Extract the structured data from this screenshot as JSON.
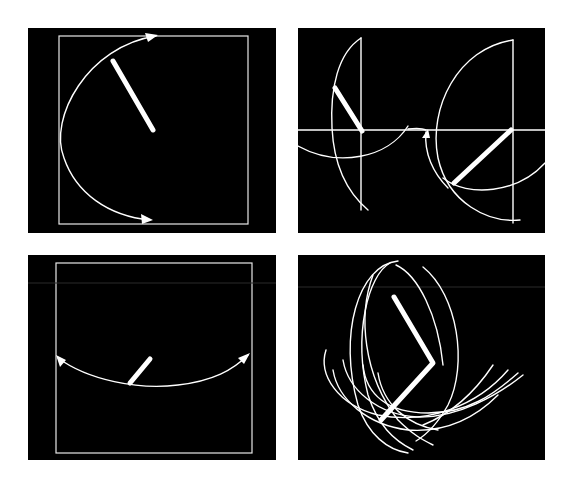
{
  "figure": {
    "panels": [
      {
        "id": "top-left",
        "description": "Rod pivoting from center within square frame; arc with arrows at top and bottom indicating swing"
      },
      {
        "id": "top-right",
        "description": "Two rods on a horizontal axis, each with circular swing arcs and a connecting arrow"
      },
      {
        "id": "bottom-left",
        "description": "Short rod at bottom of square frame with a shallow arc with arrows on both ends"
      },
      {
        "id": "bottom-right",
        "description": "Bent two-segment rod with many overlapping elliptical trace curves"
      }
    ],
    "colors": {
      "background": "#000000",
      "stroke": "#ffffff",
      "page": "#ffffff"
    }
  }
}
